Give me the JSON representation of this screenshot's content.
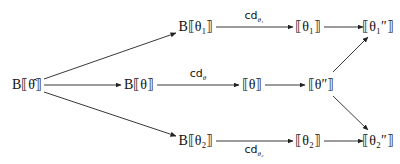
{
  "diagram": {
    "nodes": {
      "b_theta_hat": {
        "text": "B⟦θ̂⟧",
        "x": 27,
        "y": 83
      },
      "b_theta_1": {
        "text": "B⟦θ₁⟧",
        "x": 196,
        "y": 27
      },
      "b_theta": {
        "text": "B⟦θ⟧",
        "x": 139,
        "y": 83
      },
      "b_theta_2": {
        "text": "B⟦θ₂⟧",
        "x": 196,
        "y": 138
      },
      "theta_1": {
        "text": "⟦θ₁⟧",
        "x": 308,
        "y": 27
      },
      "theta": {
        "text": "⟦θ⟧",
        "x": 252,
        "y": 83
      },
      "theta_pp": {
        "text": "⟦θ″⟧",
        "x": 321,
        "y": 83
      },
      "theta_2": {
        "text": "⟦θ₂⟧",
        "x": 308,
        "y": 138
      },
      "theta_1_pp": {
        "text": "⟦θ₁″⟧",
        "x": 378,
        "y": 27
      },
      "theta_2_pp": {
        "text": "⟦θ₂″⟧",
        "x": 378,
        "y": 138
      }
    },
    "edge_labels": {
      "cd_theta_1": {
        "base": "cd",
        "sub": "θ₁"
      },
      "cd_theta": {
        "base": "cd",
        "sub": "θ"
      },
      "cd_theta_2": {
        "base": "cd",
        "sub": "θ₂"
      }
    },
    "edges": [
      {
        "from": "b_theta_hat",
        "to": "b_theta_1"
      },
      {
        "from": "b_theta_hat",
        "to": "b_theta"
      },
      {
        "from": "b_theta_hat",
        "to": "b_theta_2"
      },
      {
        "from": "b_theta_1",
        "to": "theta_1",
        "label": "cd_theta_1"
      },
      {
        "from": "b_theta",
        "to": "theta",
        "label": "cd_theta"
      },
      {
        "from": "b_theta_2",
        "to": "theta_2",
        "label": "cd_theta_2"
      },
      {
        "from": "theta_1",
        "to": "theta_1_pp"
      },
      {
        "from": "theta",
        "to": "theta_pp"
      },
      {
        "from": "theta_2",
        "to": "theta_2_pp"
      },
      {
        "from": "theta_pp",
        "to": "theta_1_pp"
      },
      {
        "from": "theta_pp",
        "to": "theta_2_pp"
      }
    ]
  }
}
